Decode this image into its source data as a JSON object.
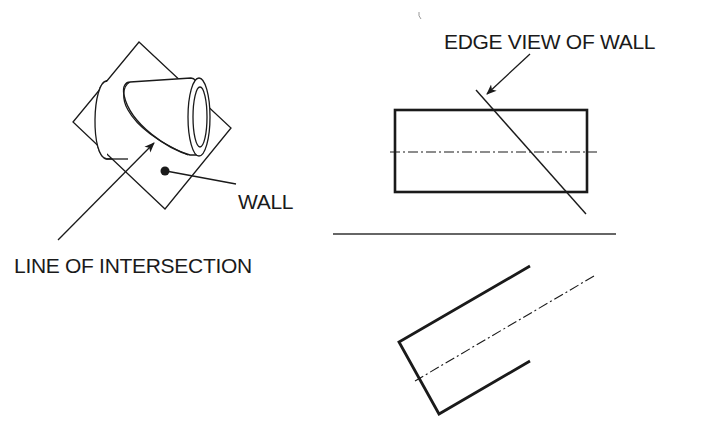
{
  "diagram": {
    "type": "technical-drawing",
    "colors": {
      "ink": "#1a1a1a",
      "background": "#ffffff"
    },
    "labels": {
      "wall": "WALL",
      "line_of_intersection": "LINE OF INTERSECTION",
      "edge_view_of_wall": "EDGE VIEW OF WALL"
    },
    "views": [
      {
        "name": "pictorial-view",
        "description": "Cylinder passing obliquely through a square wall plane"
      },
      {
        "name": "front-view",
        "description": "Rectangle (cylinder side view) with centerline and edge view of wall"
      },
      {
        "name": "auxiliary-view",
        "description": "Truncated cylinder cut at wall angle with centerline"
      }
    ]
  }
}
